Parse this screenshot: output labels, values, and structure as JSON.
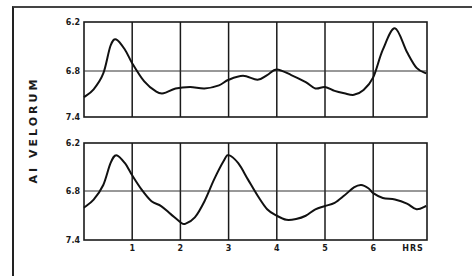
{
  "chart_data": [
    {
      "type": "line",
      "title": "",
      "xlabel": "HRS",
      "ylabel": "AI VELORUM",
      "y_tick_labels": [
        "6.2",
        "6.8",
        "7.4"
      ],
      "ylim": [
        7.4,
        6.2
      ],
      "y_inverted": true,
      "xlim": [
        0,
        7.1
      ],
      "x_tick_labels": [],
      "grid": true,
      "series": [
        {
          "name": "top",
          "x": [
            0,
            0.2,
            0.4,
            0.55,
            0.67,
            0.85,
            1.0,
            1.25,
            1.5,
            1.65,
            1.9,
            2.2,
            2.5,
            2.8,
            3.0,
            3.3,
            3.6,
            3.8,
            4.0,
            4.3,
            4.6,
            4.8,
            5.0,
            5.2,
            5.4,
            5.6,
            5.8,
            6.0,
            6.2,
            6.45,
            6.7,
            6.9,
            7.1
          ],
          "y": [
            7.15,
            7.05,
            6.85,
            6.5,
            6.42,
            6.55,
            6.72,
            6.95,
            7.08,
            7.1,
            7.04,
            7.02,
            7.04,
            7.0,
            6.93,
            6.88,
            6.93,
            6.87,
            6.8,
            6.87,
            6.96,
            7.04,
            7.02,
            7.07,
            7.1,
            7.12,
            7.06,
            6.9,
            6.55,
            6.28,
            6.58,
            6.78,
            6.85
          ]
        },
        {
          "name": "bottom",
          "x": [
            0,
            0.2,
            0.4,
            0.55,
            0.67,
            0.85,
            1.0,
            1.2,
            1.4,
            1.6,
            1.8,
            2.0,
            2.1,
            2.3,
            2.5,
            2.7,
            2.9,
            3.0,
            3.2,
            3.4,
            3.6,
            3.8,
            4.0,
            4.2,
            4.4,
            4.6,
            4.8,
            5.0,
            5.2,
            5.4,
            5.6,
            5.75,
            5.9,
            6.0,
            6.2,
            6.45,
            6.7,
            6.9,
            7.1
          ],
          "y": [
            7.0,
            6.9,
            6.72,
            6.45,
            6.35,
            6.45,
            6.6,
            6.78,
            6.92,
            6.98,
            7.08,
            7.18,
            7.2,
            7.12,
            6.92,
            6.65,
            6.42,
            6.35,
            6.45,
            6.65,
            6.85,
            7.02,
            7.1,
            7.15,
            7.14,
            7.1,
            7.02,
            6.98,
            6.94,
            6.85,
            6.75,
            6.72,
            6.76,
            6.82,
            6.88,
            6.9,
            6.95,
            7.02,
            6.98
          ]
        }
      ]
    }
  ],
  "labels": {
    "y_axis": "AI VELORUM",
    "x_unit": "HRS",
    "x_ticks": [
      "1",
      "2",
      "3",
      "4",
      "5",
      "6"
    ],
    "y_ticks_top": [
      "6.2",
      "6.8",
      "7.4"
    ],
    "y_ticks_bottom": [
      "6.2",
      "6.8",
      "7.4"
    ]
  }
}
